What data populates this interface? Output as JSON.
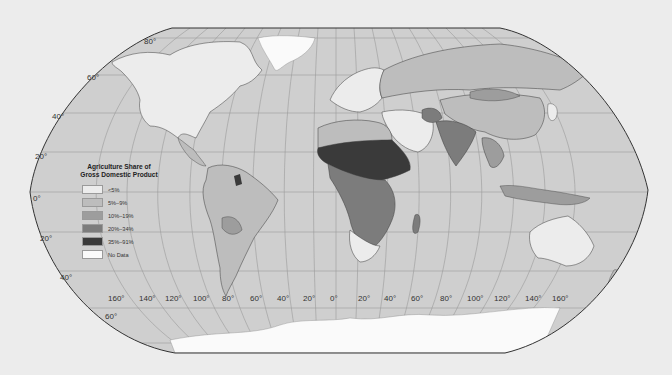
{
  "map": {
    "title": "Agriculture Share of Gross Domestic Product",
    "projection": "Robinson",
    "background_color": "#ececec",
    "ocean_color": "#cfcfcf",
    "graticule_color": "#9a9a9a",
    "border_color": "#3a3a3a"
  },
  "legend": {
    "title_line1": "Agriculture Share of",
    "title_line2": "Gross Domestic Product",
    "items": [
      {
        "label": "<5%",
        "color": "#ececec"
      },
      {
        "label": "5%–9%",
        "color": "#bdbdbd"
      },
      {
        "label": "10%–19%",
        "color": "#9d9d9d"
      },
      {
        "label": "20%–34%",
        "color": "#7c7c7c"
      },
      {
        "label": "35%–91%",
        "color": "#3a3a3a"
      },
      {
        "label": "No Data",
        "color": "#fafafa"
      }
    ]
  },
  "latitude_labels": [
    {
      "text": "80°",
      "x": 144,
      "y": 37
    },
    {
      "text": "60°",
      "x": 87,
      "y": 73
    },
    {
      "text": "40°",
      "x": 52,
      "y": 112
    },
    {
      "text": "20°",
      "x": 35,
      "y": 152
    },
    {
      "text": "0°",
      "x": 33,
      "y": 194
    },
    {
      "text": "20°",
      "x": 40,
      "y": 234
    },
    {
      "text": "40°",
      "x": 60,
      "y": 273
    },
    {
      "text": "60°",
      "x": 105,
      "y": 312
    }
  ],
  "longitude_labels": [
    {
      "text": "160°",
      "x": 108,
      "y": 294
    },
    {
      "text": "140°",
      "x": 139,
      "y": 294
    },
    {
      "text": "120°",
      "x": 165,
      "y": 294
    },
    {
      "text": "100°",
      "x": 193,
      "y": 294
    },
    {
      "text": "80°",
      "x": 222,
      "y": 294
    },
    {
      "text": "60°",
      "x": 250,
      "y": 294
    },
    {
      "text": "40°",
      "x": 277,
      "y": 294
    },
    {
      "text": "20°",
      "x": 303,
      "y": 294
    },
    {
      "text": "0°",
      "x": 330,
      "y": 294
    },
    {
      "text": "20°",
      "x": 358,
      "y": 294
    },
    {
      "text": "40°",
      "x": 384,
      "y": 294
    },
    {
      "text": "60°",
      "x": 411,
      "y": 294
    },
    {
      "text": "80°",
      "x": 440,
      "y": 294
    },
    {
      "text": "100°",
      "x": 467,
      "y": 294
    },
    {
      "text": "120°",
      "x": 494,
      "y": 294
    },
    {
      "text": "140°",
      "x": 525,
      "y": 294
    },
    {
      "text": "160°",
      "x": 552,
      "y": 294
    }
  ]
}
